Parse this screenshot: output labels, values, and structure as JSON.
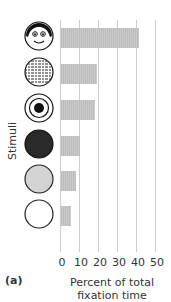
{
  "chart_data": {
    "type": "bar",
    "orientation": "horizontal",
    "title": "",
    "panel_label": "(a)",
    "xlabel": "Percent of total fixation time",
    "ylabel": "Stimuli",
    "xlim": [
      0,
      50
    ],
    "xticks": [
      0,
      10,
      20,
      30,
      40,
      50
    ],
    "grid": true,
    "categories": [
      "Face",
      "Printed text (newsprint)",
      "Bull's-eye",
      "Black disk",
      "Gray disk",
      "White disk"
    ],
    "values": [
      41,
      19,
      18,
      10,
      8,
      5
    ],
    "bar_color": "#c4c4c4"
  },
  "labels": {
    "panel": "(a)",
    "xlabel_line1": "Percent of total",
    "xlabel_line2": "fixation time",
    "ylabel": "Stimuli",
    "ticks": [
      "0",
      "10",
      "20",
      "30",
      "40",
      "50"
    ]
  }
}
